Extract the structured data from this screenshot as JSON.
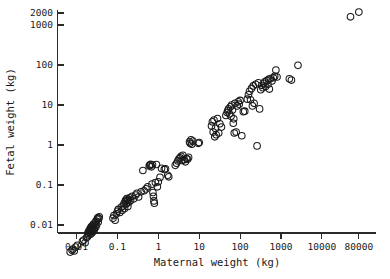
{
  "chart_data": {
    "type": "scatter",
    "title": "",
    "xlabel": "Maternal weight (kg)",
    "ylabel": "Fetal weight (kg)",
    "xscale": "log",
    "yscale": "log",
    "grid": false,
    "legend": null,
    "xlim": [
      0.006,
      200000
    ],
    "ylim": [
      0.0017,
      3000
    ],
    "xticks": [
      0.01,
      0.1,
      1,
      10,
      100,
      1000,
      10000,
      80000
    ],
    "xticklabels": [
      "0.01",
      "0.1",
      "1",
      "10",
      "100",
      "1000",
      "10000",
      "80000"
    ],
    "yticks": [
      0.01,
      0.1,
      1,
      10,
      100,
      1000,
      2000
    ],
    "yticklabels": [
      "0.01",
      "0.1",
      "1",
      "10",
      "100",
      "1000",
      "2000"
    ],
    "marker": "open-circle",
    "marker_size": 4.2,
    "points": [
      [
        0.007,
        0.0021
      ],
      [
        0.0078,
        0.00235
      ],
      [
        0.0082,
        0.0025
      ],
      [
        0.0088,
        0.00225
      ],
      [
        0.0095,
        0.0028
      ],
      [
        0.0105,
        0.0031
      ],
      [
        0.014,
        0.0039
      ],
      [
        0.015,
        0.0042
      ],
      [
        0.0162,
        0.0036
      ],
      [
        0.0175,
        0.0048
      ],
      [
        0.0185,
        0.0051
      ],
      [
        0.019,
        0.0062
      ],
      [
        0.0196,
        0.0068
      ],
      [
        0.02,
        0.0056
      ],
      [
        0.0205,
        0.0073
      ],
      [
        0.021,
        0.0066
      ],
      [
        0.0215,
        0.008
      ],
      [
        0.022,
        0.0059
      ],
      [
        0.0225,
        0.0087
      ],
      [
        0.023,
        0.0071
      ],
      [
        0.0235,
        0.0093
      ],
      [
        0.024,
        0.0064
      ],
      [
        0.0245,
        0.0078
      ],
      [
        0.025,
        0.0095
      ],
      [
        0.0255,
        0.007
      ],
      [
        0.026,
        0.0105
      ],
      [
        0.0265,
        0.0083
      ],
      [
        0.0272,
        0.0076
      ],
      [
        0.028,
        0.0099
      ],
      [
        0.0288,
        0.0115
      ],
      [
        0.0295,
        0.0088
      ],
      [
        0.03,
        0.0125
      ],
      [
        0.031,
        0.0102
      ],
      [
        0.032,
        0.0138
      ],
      [
        0.033,
        0.0152
      ],
      [
        0.034,
        0.0118
      ],
      [
        0.035,
        0.0146
      ],
      [
        0.036,
        0.016
      ],
      [
        0.078,
        0.0148
      ],
      [
        0.082,
        0.0172
      ],
      [
        0.088,
        0.0132
      ],
      [
        0.095,
        0.019
      ],
      [
        0.1,
        0.022
      ],
      [
        0.105,
        0.0245
      ],
      [
        0.115,
        0.0205
      ],
      [
        0.125,
        0.028
      ],
      [
        0.132,
        0.0235
      ],
      [
        0.14,
        0.03
      ],
      [
        0.145,
        0.0345
      ],
      [
        0.15,
        0.026
      ],
      [
        0.155,
        0.039
      ],
      [
        0.16,
        0.042
      ],
      [
        0.165,
        0.0335
      ],
      [
        0.17,
        0.046
      ],
      [
        0.175,
        0.04
      ],
      [
        0.18,
        0.029
      ],
      [
        0.185,
        0.0435
      ],
      [
        0.19,
        0.037
      ],
      [
        0.2,
        0.048
      ],
      [
        0.21,
        0.041
      ],
      [
        0.23,
        0.052
      ],
      [
        0.25,
        0.045
      ],
      [
        0.28,
        0.056
      ],
      [
        0.3,
        0.062
      ],
      [
        0.33,
        0.05
      ],
      [
        0.38,
        0.068
      ],
      [
        0.42,
        0.23
      ],
      [
        0.45,
        0.072
      ],
      [
        0.5,
        0.08
      ],
      [
        0.55,
        0.09
      ],
      [
        0.6,
        0.3
      ],
      [
        0.62,
        0.315
      ],
      [
        0.65,
        0.33
      ],
      [
        0.68,
        0.285
      ],
      [
        0.7,
        0.105
      ],
      [
        0.72,
        0.32
      ],
      [
        0.74,
        0.065
      ],
      [
        0.76,
        0.052
      ],
      [
        0.78,
        0.04
      ],
      [
        0.8,
        0.035
      ],
      [
        0.85,
        0.115
      ],
      [
        0.9,
        0.325
      ],
      [
        0.95,
        0.09
      ],
      [
        1.0,
        0.12
      ],
      [
        1.1,
        0.155
      ],
      [
        1.2,
        0.26
      ],
      [
        1.4,
        0.245
      ],
      [
        1.5,
        0.255
      ],
      [
        1.7,
        0.175
      ],
      [
        1.8,
        0.16
      ],
      [
        2.6,
        0.31
      ],
      [
        2.8,
        0.35
      ],
      [
        3.0,
        0.4
      ],
      [
        3.2,
        0.45
      ],
      [
        3.4,
        0.48
      ],
      [
        3.6,
        0.52
      ],
      [
        3.8,
        0.41
      ],
      [
        4.0,
        0.55
      ],
      [
        4.3,
        0.43
      ],
      [
        4.6,
        0.38
      ],
      [
        4.9,
        0.46
      ],
      [
        5.2,
        0.44
      ],
      [
        5.5,
        0.49
      ],
      [
        5.8,
        1.2
      ],
      [
        6.0,
        1.1
      ],
      [
        6.3,
        1.35
      ],
      [
        6.6,
        1.05
      ],
      [
        7.0,
        1.25
      ],
      [
        9.5,
        1.1
      ],
      [
        10.0,
        1.15
      ],
      [
        20.0,
        3.0
      ],
      [
        21.0,
        3.8
      ],
      [
        22.0,
        2.1
      ],
      [
        23.0,
        4.2
      ],
      [
        24.0,
        1.6
      ],
      [
        25.0,
        2.6
      ],
      [
        26.0,
        1.8
      ],
      [
        28.0,
        4.6
      ],
      [
        30.0,
        2.0
      ],
      [
        32.0,
        3.4
      ],
      [
        35.0,
        2.8
      ],
      [
        45.0,
        5.5
      ],
      [
        48.0,
        6.5
      ],
      [
        50.0,
        7.2
      ],
      [
        52.0,
        8.0
      ],
      [
        55.0,
        6.0
      ],
      [
        58.0,
        9.0
      ],
      [
        60.0,
        5.2
      ],
      [
        62.0,
        10.0
      ],
      [
        65.0,
        7.5
      ],
      [
        68.0,
        3.5
      ],
      [
        70.0,
        4.5
      ],
      [
        72.0,
        2.0
      ],
      [
        75.0,
        11.0
      ],
      [
        80.0,
        2.1
      ],
      [
        85.0,
        9.5
      ],
      [
        90.0,
        12.0
      ],
      [
        95.0,
        10.5
      ],
      [
        100.0,
        13.0
      ],
      [
        110.0,
        1.7
      ],
      [
        120.0,
        6.8
      ],
      [
        130.0,
        7.0
      ],
      [
        150.0,
        14.0
      ],
      [
        160.0,
        18.0
      ],
      [
        170.0,
        22.0
      ],
      [
        180.0,
        13.5
      ],
      [
        190.0,
        26.0
      ],
      [
        200.0,
        9.5
      ],
      [
        210.0,
        30.0
      ],
      [
        220.0,
        11.0
      ],
      [
        240.0,
        33.0
      ],
      [
        260.0,
        0.95
      ],
      [
        280.0,
        36.0
      ],
      [
        300.0,
        8.0
      ],
      [
        320.0,
        24.0
      ],
      [
        340.0,
        31.0
      ],
      [
        360.0,
        27.0
      ],
      [
        380.0,
        35.0
      ],
      [
        400.0,
        38.0
      ],
      [
        420.0,
        29.0
      ],
      [
        450.0,
        41.0
      ],
      [
        480.0,
        33.0
      ],
      [
        500.0,
        44.0
      ],
      [
        520.0,
        25.0
      ],
      [
        550.0,
        46.0
      ],
      [
        600.0,
        40.0
      ],
      [
        650.0,
        48.0
      ],
      [
        700.0,
        52.0
      ],
      [
        750.0,
        75.0
      ],
      [
        800.0,
        50.0
      ],
      [
        1600.0,
        45.0
      ],
      [
        1800.0,
        42.0
      ],
      [
        2600.0,
        98.0
      ],
      [
        50000.0,
        1600.0
      ],
      [
        80000.0,
        2100.0
      ]
    ]
  },
  "axes": {
    "x_axis_name": "maternal-weight-axis",
    "y_axis_name": "fetal-weight-axis"
  }
}
